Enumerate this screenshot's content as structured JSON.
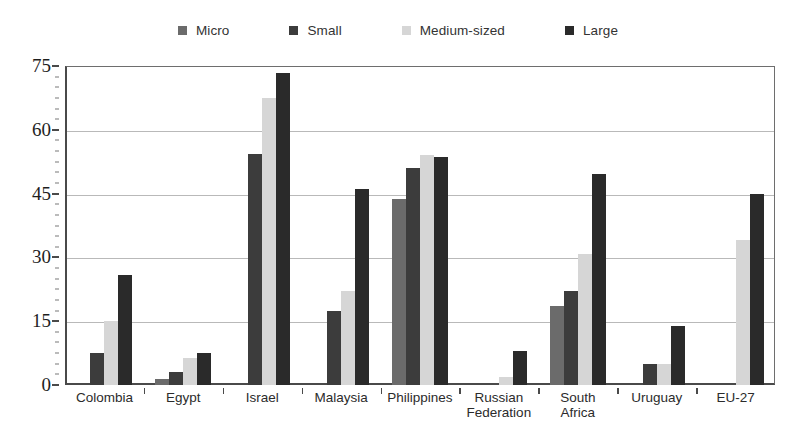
{
  "chart_data": {
    "type": "bar",
    "title": "",
    "subtitle": "",
    "xlabel": "",
    "ylabel": "",
    "ylim": [
      0,
      75
    ],
    "yticks": [
      0,
      15,
      30,
      45,
      60,
      75
    ],
    "ytick_labels": [
      "0",
      "15",
      "30",
      "45",
      "60",
      "75"
    ],
    "grid": true,
    "grid_axis": "y",
    "legend_position": "top-center",
    "bar_orientation": "vertical",
    "categories": [
      "Colombia",
      "Egypt",
      "Israel",
      "Malaysia",
      "Philippines",
      "Russian\nFederation",
      "South\nAfrica",
      "Uruguay",
      "EU-27"
    ],
    "series": [
      {
        "name": "Micro",
        "color": "#6b6b6b",
        "values": [
          null,
          1.5,
          null,
          null,
          43.8,
          null,
          18.5,
          null,
          null
        ]
      },
      {
        "name": "Small",
        "color": "#3c3c3c",
        "values": [
          7.6,
          3.0,
          54.2,
          17.3,
          51.0,
          null,
          22.2,
          5.0,
          null
        ]
      },
      {
        "name": "Medium-sized",
        "color": "#d6d6d6",
        "values": [
          15.0,
          6.4,
          67.4,
          22.2,
          54.0,
          2.0,
          30.9,
          5.0,
          34.0
        ]
      },
      {
        "name": "Large",
        "color": "#2a2a2a",
        "values": [
          25.9,
          7.5,
          73.3,
          46.1,
          53.5,
          8.0,
          49.5,
          13.9,
          45.0
        ]
      }
    ]
  },
  "legend": {
    "items": [
      {
        "label": "Micro",
        "color": "#6b6b6b"
      },
      {
        "label": "Small",
        "color": "#3c3c3c"
      },
      {
        "label": "Medium-sized",
        "color": "#d6d6d6"
      },
      {
        "label": "Large",
        "color": "#2a2a2a"
      }
    ]
  },
  "axes": {
    "y": {
      "ticks": [
        "0",
        "15",
        "30",
        "45",
        "60",
        "75"
      ]
    },
    "x": {
      "ticks": [
        "Colombia",
        "Egypt",
        "Israel",
        "Malaysia",
        "Philippines",
        "Russian\nFederation",
        "South\nAfrica",
        "Uruguay",
        "EU-27"
      ]
    }
  },
  "colors": {
    "axis": "#4a4a4a",
    "grid": "#b9b9b9",
    "background": "#ffffff",
    "text": "#2b2b2b"
  }
}
